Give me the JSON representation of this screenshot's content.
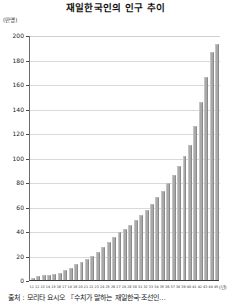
{
  "chart_data": {
    "type": "bar",
    "title": "재일한국인의 인구 추이",
    "xlabel": "(년)",
    "ylabel": "(만명)",
    "ylim": [
      0,
      200
    ],
    "ytick_values": [
      0,
      20,
      40,
      60,
      80,
      100,
      120,
      140,
      160,
      180,
      200
    ],
    "ytick_labels": [
      "0",
      "20",
      "40",
      "60",
      "80",
      "100",
      "120",
      "140",
      "160",
      "180",
      "200"
    ],
    "grid": true,
    "legend": "none",
    "bar_color": "#a9a9a9",
    "categories": [
      "11",
      "12",
      "13",
      "14",
      "15",
      "16",
      "17",
      "18",
      "19",
      "20",
      "21",
      "22",
      "23",
      "24",
      "25",
      "26",
      "27",
      "28",
      "29",
      "30",
      "31",
      "32",
      "33",
      "34",
      "35",
      "36",
      "37",
      "38",
      "39",
      "40",
      "41",
      "42",
      "43",
      "44",
      "45"
    ],
    "values": [
      2,
      3,
      4,
      4,
      5,
      6,
      8,
      10,
      13,
      15,
      17,
      20,
      23,
      27,
      31,
      35,
      39,
      42,
      45,
      49,
      53,
      57,
      62,
      68,
      73,
      79,
      86,
      93,
      101,
      110,
      126,
      145,
      166,
      186,
      193
    ],
    "source_note": "출처 : 모리타 요시오 『수치가 말하는 재일한국·조선인…"
  },
  "chart": {
    "title": "재일한국인의 인구 추이",
    "y_unit": "(만명)",
    "x_unit": "(년)",
    "source": "출처 : 모리타 요시오 『수치가 말하는 재일한국·조선인…"
  }
}
